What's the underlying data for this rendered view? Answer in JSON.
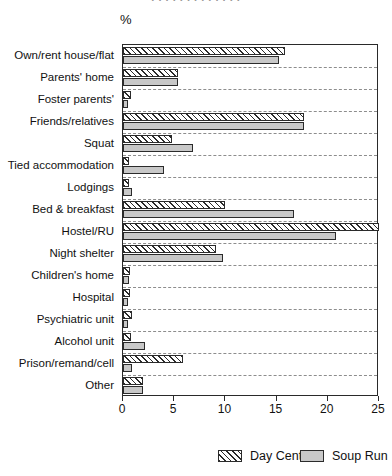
{
  "page": {
    "cut_caption": "· · · · · · · · · · · · ·",
    "unit_label": "%"
  },
  "legend": {
    "position": "bottom-right",
    "items": [
      {
        "label": "Day Centre",
        "pattern": "diagonal-hatch",
        "color": "#ffffff"
      },
      {
        "label": "Soup Run",
        "pattern": "solid",
        "color": "#c8c8c8"
      }
    ]
  },
  "axis": {
    "x_ticks": [
      0,
      5,
      10,
      15,
      20,
      25
    ],
    "x_tick_labels": [
      "0",
      "5",
      "10",
      "15",
      "20",
      "25"
    ],
    "xlim": [
      0,
      25
    ]
  },
  "chart_data": {
    "type": "bar",
    "orientation": "horizontal",
    "title": "",
    "subtitle": "",
    "xlabel": "%",
    "ylabel": "",
    "xlim": [
      0,
      25
    ],
    "grid": "horizontal-dashed",
    "legend_position": "bottom-right",
    "categories": [
      "Own/rent house/flat",
      "Parents' home",
      "Foster parents'",
      "Friends/relatives",
      "Squat",
      "Tied accommodation",
      "Lodgings",
      "Bed & breakfast",
      "Hostel/RU",
      "Night shelter",
      "Children's home",
      "Hospital",
      "Psychiatric unit",
      "Alcohol unit",
      "Prison/remand/cell",
      "Other"
    ],
    "series": [
      {
        "name": "Day Centre",
        "values": [
          15.8,
          5.4,
          0.8,
          17.7,
          4.8,
          0.6,
          0.6,
          10.0,
          25.0,
          9.1,
          0.7,
          0.7,
          0.9,
          0.8,
          5.9,
          2.0
        ]
      },
      {
        "name": "Soup Run",
        "values": [
          15.2,
          5.4,
          0.3,
          17.7,
          6.8,
          4.0,
          0.9,
          16.7,
          20.8,
          9.8,
          0.6,
          0.4,
          0.4,
          2.1,
          0.9,
          2.0
        ]
      }
    ]
  }
}
